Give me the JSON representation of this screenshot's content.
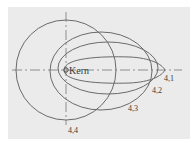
{
  "diagram": {
    "nucleus_label": "Kern",
    "orbits": [
      {
        "label": "4,1",
        "shape": "ellipse"
      },
      {
        "label": "4,2",
        "shape": "ellipse"
      },
      {
        "label": "4,3",
        "shape": "ellipse"
      },
      {
        "label": "4,4",
        "shape": "circle"
      }
    ],
    "colors": {
      "background": "#ebebeb",
      "line": "#6a6a6a",
      "text": "#3a3a3a"
    }
  }
}
